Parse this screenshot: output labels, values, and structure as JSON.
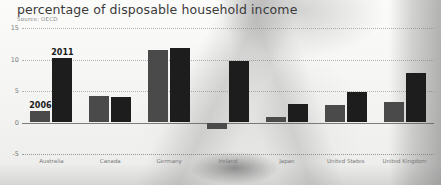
{
  "header": {
    "title": "percentage of disposable household income",
    "source": "Source: OECD"
  },
  "legend": {
    "series_2006_label": "2006",
    "series_2011_label": "2011"
  },
  "colors": {
    "series_2006": "#4a4a4a",
    "series_2011": "#1d1d1d",
    "grid": "#9a9a9a",
    "text": "#3a3a3a"
  },
  "chart_data": {
    "type": "bar",
    "title": "percentage of disposable household income",
    "subtitle": "Source: OECD",
    "xlabel": "",
    "ylabel": "",
    "ylim": [
      -5,
      15
    ],
    "yticks": [
      -5,
      0,
      5,
      10,
      15
    ],
    "ytick_labels": [
      "-5",
      "0",
      "5",
      "10",
      "15"
    ],
    "grid": true,
    "legend_position": "in-plot-above-bars",
    "categories": [
      "Australia",
      "Canada",
      "Germany",
      "Ireland",
      "Japan",
      "United States",
      "United Kingdom"
    ],
    "series": [
      {
        "name": "2006",
        "values": [
          1.8,
          4.2,
          11.5,
          -1.1,
          0.9,
          2.7,
          3.3
        ]
      },
      {
        "name": "2011",
        "values": [
          10.3,
          4.0,
          11.8,
          9.8,
          2.9,
          4.9,
          7.9
        ]
      }
    ],
    "annotations": [
      {
        "text": "2006",
        "series": "2006",
        "category": "Australia"
      },
      {
        "text": "2011",
        "series": "2011",
        "category": "Australia"
      }
    ]
  }
}
